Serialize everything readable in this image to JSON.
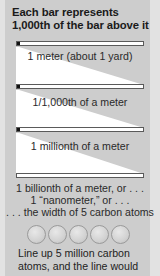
{
  "title": {
    "line1": "Each bar represents",
    "line2": "1,000th of the bar above it"
  },
  "bars": [
    {
      "label": "1 meter (about 1 yard)"
    },
    {
      "label": "1/1,000th of a meter"
    },
    {
      "label": "1 millionth of a meter"
    },
    {
      "label_lines": [
        "1 billionth of a meter, or . . .",
        "1 “nanometer,” or . . .",
        ". . . the width of 5 carbon atoms"
      ]
    }
  ],
  "atoms": {
    "count": 5,
    "name": "carbon atom"
  },
  "bottom_text": {
    "line1": "Line up 5 million carbon",
    "line2": "atoms, and the line would"
  },
  "colors": {
    "panel": "#cdcdcd",
    "margin": "#e2e2e2",
    "wedge": "#ffffff",
    "bar_end": "#111111"
  }
}
